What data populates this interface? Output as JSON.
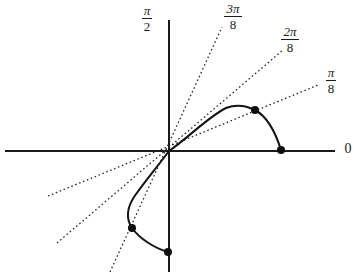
{
  "figure": {
    "background_color": "#ffffff",
    "ink_color": "#1a1a1a",
    "width": 357,
    "height": 272
  },
  "axes": {
    "horizontal": {
      "name": "horizontal-axis",
      "x1": 5,
      "y1": 151,
      "x2": 335,
      "y2": 151,
      "stroke_width": 2
    },
    "vertical": {
      "name": "vertical-axis",
      "x1": 169,
      "y1": 20,
      "x2": 169,
      "y2": 272,
      "stroke_width": 2
    },
    "origin": {
      "x": 169,
      "y": 151
    }
  },
  "labels": [
    {
      "id": "label-pi-over-2",
      "name": "axis-label-pi-over-2",
      "kind": "fraction",
      "numerator": "π",
      "denominator": "2",
      "text": "π/2",
      "x": 130,
      "y": 4
    },
    {
      "id": "label-3pi-over-8",
      "name": "ray-label-3pi-over-8",
      "kind": "fraction",
      "numerator": "3π",
      "denominator": "8",
      "text": "3π/8",
      "x": 213,
      "y": 2
    },
    {
      "id": "label-2pi-over-8",
      "name": "ray-label-2pi-over-8",
      "kind": "fraction",
      "numerator": "2π",
      "denominator": "8",
      "text": "2π/8",
      "x": 270,
      "y": 25
    },
    {
      "id": "label-pi-over-8",
      "name": "ray-label-pi-over-8",
      "kind": "fraction",
      "numerator": "π",
      "denominator": "8",
      "text": "π/8",
      "x": 317,
      "y": 66
    },
    {
      "id": "label-zero",
      "name": "axis-label-zero",
      "kind": "plain",
      "text": "0",
      "x": 341,
      "y": 142
    }
  ],
  "rays": [
    {
      "name": "dotted-ray-3pi-over-8",
      "label": "3π/8",
      "x1": 110,
      "y1": 272,
      "x2": 222,
      "y2": 27,
      "dash": "1.6 2.6",
      "stroke_width": 1.3
    },
    {
      "name": "dotted-ray-2pi-over-8",
      "label": "2π/8",
      "x1": 57,
      "y1": 243,
      "x2": 283,
      "y2": 50,
      "dash": "1.6 2.6",
      "stroke_width": 1.3
    },
    {
      "name": "dotted-ray-pi-over-8",
      "label": "π/8",
      "x1": 48,
      "y1": 196,
      "x2": 318,
      "y2": 85,
      "dash": "1.6 2.6",
      "stroke_width": 1.3
    }
  ],
  "curve": {
    "name": "solid-curve",
    "stroke_width": 2,
    "upper_branch_path": "M 169,151 C 188,138 208,117 226,108 C 236,104 247,106 255,110 C 268,117 276,134 281,150",
    "lower_branch_path": "M 169,151 C 158,166 145,181 134,197 C 127,208 126,219 132,228 C 139,238 154,248 168,252"
  },
  "points": [
    {
      "name": "curve-point-upper-right",
      "x": 255,
      "y": 110,
      "radius": 4
    },
    {
      "name": "curve-point-on-x-axis",
      "x": 281,
      "y": 150,
      "radius": 4
    },
    {
      "name": "curve-point-lower-left",
      "x": 132,
      "y": 228,
      "radius": 4
    },
    {
      "name": "curve-point-on-y-axis",
      "x": 168,
      "y": 252,
      "radius": 4
    }
  ]
}
